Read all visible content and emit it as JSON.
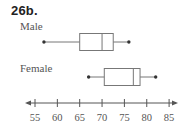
{
  "title": "26b.",
  "chart_data": {
    "type": "boxplot",
    "title": "26b.",
    "orientation": "horizontal",
    "xlabel": "",
    "ylabel": "",
    "xlim": [
      54,
      86
    ],
    "ticks": [
      55,
      60,
      65,
      70,
      75,
      80,
      85
    ],
    "tick_labels": [
      "55",
      "60",
      "65",
      "70",
      "75",
      "80",
      "85"
    ],
    "grid": false,
    "series": [
      {
        "name": "Male",
        "min": 57,
        "q1": 65,
        "median": 70,
        "q3": 72.5,
        "max": 76
      },
      {
        "name": "Female",
        "min": 67,
        "q1": 70.5,
        "median": 77,
        "q3": 78.5,
        "max": 82
      }
    ],
    "colors": {
      "line": "#777777",
      "dot": "#333333",
      "axis": "#555555"
    }
  },
  "labels": {
    "male": "Male",
    "female": "Female"
  }
}
